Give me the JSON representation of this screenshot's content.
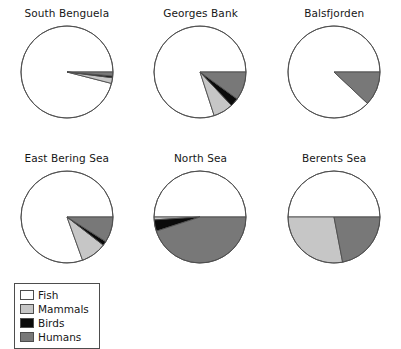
{
  "figure": {
    "background_color": "#ffffff",
    "outline_color": "#4d4d4d"
  },
  "legend": {
    "title": "",
    "entries": [
      {
        "label": "Fish",
        "color": "#ffffff"
      },
      {
        "label": "Mammals",
        "color": "#c6c6c6"
      },
      {
        "label": "Birds",
        "color": "#0a0a0a"
      },
      {
        "label": "Humans",
        "color": "#787878"
      }
    ]
  },
  "chart_data": {
    "type": "pie",
    "title": "",
    "legend_position": "bottom-left",
    "categories": [
      "Fish",
      "Mammals",
      "Birds",
      "Humans"
    ],
    "colors": [
      "#ffffff",
      "#c6c6c6",
      "#0a0a0a",
      "#787878"
    ],
    "start_angle_deg": 0,
    "direction": "counterclockwise",
    "panels": [
      {
        "title": "South Benguela",
        "values": [
          96.0,
          2.0,
          0.6,
          1.4
        ]
      },
      {
        "title": "Georges Bank",
        "values": [
          80.0,
          7.0,
          3.0,
          10.0
        ]
      },
      {
        "title": "Balsfjorden",
        "values": [
          88.0,
          0.0,
          0.0,
          12.0
        ]
      },
      {
        "title": "East Bering Sea",
        "values": [
          80.5,
          9.0,
          1.5,
          9.0
        ]
      },
      {
        "title": "North Sea",
        "values": [
          50.0,
          1.0,
          4.0,
          45.0
        ]
      },
      {
        "title": "Berents Sea",
        "values": [
          50.0,
          28.0,
          0.0,
          22.0
        ]
      }
    ]
  }
}
